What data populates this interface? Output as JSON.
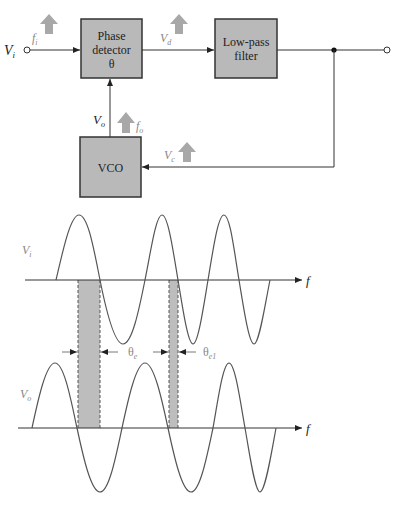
{
  "diagram": {
    "colors": {
      "block_fill": "#b9b9b9",
      "block_stroke": "#333333",
      "wire": "#333333",
      "freq_arrow": "#a8a8a8",
      "shade": "#bdbdbd",
      "wave": "#555555",
      "label_gray": "#888888"
    },
    "blocks": {
      "phase_detector": {
        "line1": "Phase",
        "line2": "detector",
        "line3": "θ"
      },
      "low_pass_filter": {
        "line1": "Low-pass",
        "line2": "filter"
      },
      "vco": {
        "label": "VCO"
      }
    },
    "signals": {
      "input_voltage": {
        "main": "V",
        "sub": "i"
      },
      "input_freq": {
        "main": "f",
        "sub": "i"
      },
      "detector_output": {
        "main": "V",
        "sub": "d"
      },
      "vco_output": {
        "main": "V",
        "sub": "o"
      },
      "vco_freq": {
        "main": "f",
        "sub": "o"
      },
      "control_voltage": {
        "main": "V",
        "sub": "c"
      }
    },
    "waveforms": {
      "top_label": {
        "main": "V",
        "sub": "i"
      },
      "bottom_label": {
        "main": "V",
        "sub": "o"
      },
      "axis_label_top": "f",
      "axis_label_bottom": "f",
      "phase_error_1": {
        "main": "θ",
        "sub": "e"
      },
      "phase_error_2": {
        "main": "θ",
        "sub": "e1"
      }
    }
  }
}
